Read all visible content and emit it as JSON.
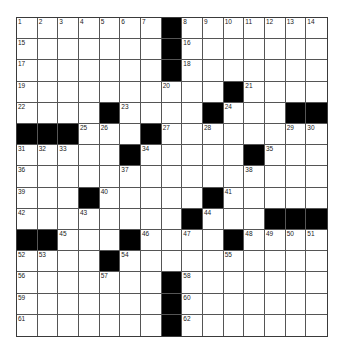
{
  "puzzle": {
    "rows": 15,
    "cols": 15,
    "grid": [
      [
        "1",
        "2",
        "3",
        "4",
        "5",
        "6",
        "7",
        "#",
        "8",
        "9",
        "10",
        "11",
        "12",
        "13",
        "14"
      ],
      [
        "15",
        "",
        "",
        "",
        "",
        "",
        "",
        "#",
        "16",
        "",
        "",
        "",
        "",
        "",
        ""
      ],
      [
        "17",
        "",
        "",
        "",
        "",
        "",
        "",
        "#",
        "18",
        "",
        "",
        "",
        "",
        "",
        ""
      ],
      [
        "19",
        "",
        "",
        "",
        "",
        "",
        "",
        "20",
        "",
        "",
        "#",
        "21",
        "",
        "",
        ""
      ],
      [
        "22",
        "",
        "",
        "",
        "#",
        "23",
        "",
        "",
        "",
        "#",
        "24",
        "",
        "",
        "#",
        "#"
      ],
      [
        "#",
        "#",
        "#",
        "25",
        "26",
        "",
        "#",
        "27",
        "",
        "28",
        "",
        "",
        "",
        "29",
        "30"
      ],
      [
        "31",
        "32",
        "33",
        "",
        "",
        "#",
        "34",
        "",
        "",
        "",
        "",
        "#",
        "35",
        "",
        ""
      ],
      [
        "36",
        "",
        "",
        "",
        "",
        "37",
        "",
        "",
        "",
        "",
        "",
        "38",
        "",
        "",
        ""
      ],
      [
        "39",
        "",
        "",
        "#",
        "40",
        "",
        "",
        "",
        "",
        "#",
        "41",
        "",
        "",
        "",
        ""
      ],
      [
        "42",
        "",
        "",
        "43",
        "",
        "",
        "",
        "",
        "#",
        "44",
        "",
        "",
        "#",
        "#",
        "#"
      ],
      [
        "#",
        "#",
        "45",
        "",
        "",
        "#",
        "46",
        "",
        "47",
        "",
        "#",
        "48",
        "49",
        "50",
        "51"
      ],
      [
        "52",
        "53",
        "",
        "",
        "#",
        "54",
        "",
        "",
        "",
        "",
        "55",
        "",
        "",
        "",
        ""
      ],
      [
        "56",
        "",
        "",
        "",
        "57",
        "",
        "",
        "#",
        "58",
        "",
        "",
        "",
        "",
        "",
        ""
      ],
      [
        "59",
        "",
        "",
        "",
        "",
        "",
        "",
        "#",
        "60",
        "",
        "",
        "",
        "",
        "",
        ""
      ],
      [
        "61",
        "",
        "",
        "",
        "",
        "",
        "",
        "#",
        "62",
        "",
        "",
        "",
        "",
        "",
        ""
      ]
    ],
    "colors": {
      "block": "#000000",
      "cell": "#ffffff",
      "line": "#555555"
    }
  }
}
